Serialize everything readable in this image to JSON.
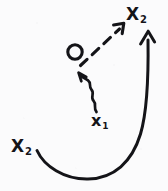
{
  "canvas": {
    "width": 168,
    "height": 191,
    "background_color": "#fbfbfc",
    "ink_color": "#141418",
    "style": "hand-drawn pen sketch on scanned paper"
  },
  "labels": {
    "target_state": {
      "base": "X",
      "subscript": "2",
      "full": "X2",
      "position": "top-right"
    },
    "source_state": {
      "base": "X",
      "subscript": "2",
      "full": "X2",
      "position": "bottom-left"
    },
    "intermediate_state": {
      "base": "x",
      "subscript": "1",
      "full": "x1",
      "position": "center-bottom"
    }
  },
  "glyphs": {
    "circle": {
      "name": "open-circle-node",
      "cx": 75,
      "cy": 52,
      "r": 7,
      "stroke_width": 3
    },
    "dashed_arrow": {
      "name": "dashed-arrow",
      "from": [
        81,
        64
      ],
      "to": [
        124,
        24
      ],
      "dash_pattern": "9 7",
      "stroke_width": 3,
      "points_toward": "X2"
    },
    "wavy_arrow": {
      "name": "wavy-arrow",
      "from": [
        96,
        112
      ],
      "to": [
        79,
        73
      ],
      "stroke_width": 2.6,
      "points_toward": "circle"
    },
    "curved_arrow": {
      "name": "curved-sweep-arrow",
      "from": [
        37,
        151
      ],
      "through": [
        95,
        179
      ],
      "to": [
        148,
        31
      ],
      "stroke_width": 3,
      "points_toward": "X2-top"
    }
  },
  "chart_data": {
    "type": "diagram",
    "title": "",
    "nodes": [
      {
        "id": "x2_source",
        "label": "X2",
        "x": 22,
        "y": 147,
        "role": "source state"
      },
      {
        "id": "x1",
        "label": "x1",
        "x": 100,
        "y": 121,
        "role": "intermediate state"
      },
      {
        "id": "circle",
        "label": "O",
        "x": 75,
        "y": 52,
        "role": "open node"
      },
      {
        "id": "x2_target",
        "label": "X2",
        "x": 137,
        "y": 15,
        "role": "target state"
      }
    ],
    "edges": [
      {
        "from": "x1",
        "to": "circle",
        "style": "wavy",
        "arrow": true
      },
      {
        "from": "circle",
        "to": "x2_target",
        "style": "dashed",
        "arrow": true
      },
      {
        "from": "x2_source",
        "to": "x2_target",
        "style": "curved-solid",
        "arrow": true
      }
    ]
  }
}
